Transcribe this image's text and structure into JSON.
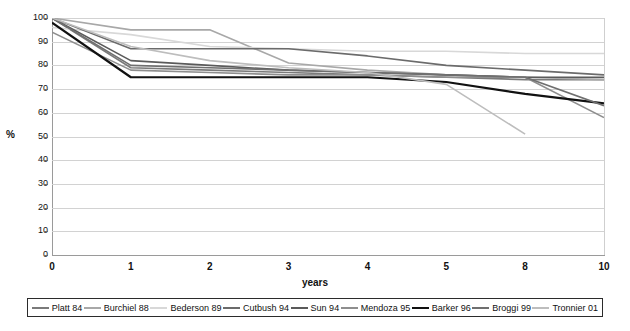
{
  "chart_data": {
    "type": "line",
    "title": "",
    "xlabel": "years",
    "ylabel": "%",
    "ylim": [
      0,
      100
    ],
    "ytick_step": 10,
    "grid": true,
    "legend_position": "bottom",
    "categories": [
      "0",
      "1",
      "2",
      "3",
      "4",
      "5",
      "8",
      "10"
    ],
    "yticks": [
      "100",
      "90",
      "80",
      "70",
      "60",
      "50",
      "40",
      "30",
      "20",
      "10",
      "0"
    ],
    "series": [
      {
        "name": "Platt 84",
        "color": "#7a7a7a",
        "width": 1.6,
        "values": [
          100,
          79,
          78,
          77,
          76,
          75,
          74,
          74
        ]
      },
      {
        "name": "Burchiel 88",
        "color": "#a8a8a8",
        "width": 1.6,
        "values": [
          100,
          95,
          95,
          81,
          78,
          76,
          75,
          74
        ]
      },
      {
        "name": "Bederson 89",
        "color": "#d8d8d8",
        "width": 1.6,
        "values": [
          96,
          93,
          88,
          87,
          86,
          86,
          85,
          85
        ]
      },
      {
        "name": "Cutbush 94",
        "color": "#6b6b6b",
        "width": 1.6,
        "values": [
          100,
          87,
          87,
          87,
          84,
          80,
          78,
          76
        ]
      },
      {
        "name": "Sun 94",
        "color": "#5a5a5a",
        "width": 1.6,
        "values": [
          100,
          82,
          80,
          78,
          77,
          76,
          75,
          75
        ]
      },
      {
        "name": "Mendoza 95",
        "color": "#8e8e8e",
        "width": 1.6,
        "values": [
          94,
          78,
          77,
          76,
          76,
          75,
          75,
          58
        ]
      },
      {
        "name": "Barker 96",
        "color": "#111111",
        "width": 2.2,
        "values": [
          98,
          75,
          75,
          75,
          75,
          73,
          68,
          64
        ]
      },
      {
        "name": "Broggi 99",
        "color": "#6f6f6f",
        "width": 1.6,
        "values": [
          100,
          80,
          79,
          78,
          77,
          76,
          75,
          63
        ]
      },
      {
        "name": "Tronnier 01",
        "color": "#bdbdbd",
        "width": 1.6,
        "values": [
          100,
          88,
          82,
          79,
          77,
          72,
          51,
          null
        ]
      }
    ]
  },
  "axis": {
    "y_title": "%",
    "x_title": "years"
  },
  "caption": {
    "text": ""
  }
}
